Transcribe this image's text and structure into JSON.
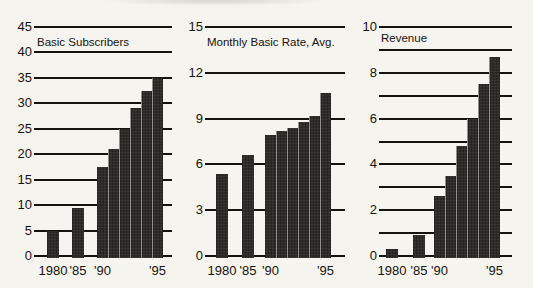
{
  "figure": {
    "background_color": "#f6f4ef",
    "ink_color": "#16120e",
    "bar_color": "#2f2b28"
  },
  "chart_data": [
    {
      "type": "bar",
      "title": "Basic Subscribers",
      "categories": [
        "1980",
        "1985",
        "1990",
        "1991",
        "1992",
        "1993",
        "1994",
        "1995"
      ],
      "values": [
        5,
        9.5,
        17.5,
        21,
        25,
        29,
        32.5,
        35
      ],
      "ylim": [
        0,
        45
      ],
      "grid_step": 5,
      "label_step": 5,
      "ytick_labels": [
        "0",
        "5",
        "10",
        "15",
        "20",
        "25",
        "30",
        "35",
        "40",
        "45"
      ],
      "xtick_labels": [
        {
          "bar_index": 0,
          "label": "1980"
        },
        {
          "bar_index": 1,
          "label": "'85"
        },
        {
          "bar_index": 2,
          "label": "'90"
        },
        {
          "bar_index": 7,
          "label": "'95"
        }
      ],
      "grid": "horizontal",
      "legend": null
    },
    {
      "type": "bar",
      "title": "Monthly Basic Rate, Avg.",
      "categories": [
        "1980",
        "1985",
        "1990",
        "1991",
        "1992",
        "1993",
        "1994",
        "1995"
      ],
      "values": [
        5.4,
        6.6,
        7.9,
        8.2,
        8.4,
        8.8,
        9.2,
        10.7
      ],
      "ylim": [
        0,
        15
      ],
      "grid_step": 3,
      "label_step": 3,
      "ytick_labels": [
        "0",
        "3",
        "6",
        "9",
        "12",
        "15"
      ],
      "xtick_labels": [
        {
          "bar_index": 0,
          "label": "1980"
        },
        {
          "bar_index": 1,
          "label": "'85"
        },
        {
          "bar_index": 2,
          "label": "'90"
        },
        {
          "bar_index": 7,
          "label": "'95"
        }
      ],
      "grid": "horizontal",
      "legend": null
    },
    {
      "type": "bar",
      "title": "Revenue",
      "categories": [
        "1980",
        "1985",
        "1990",
        "1991",
        "1992",
        "1993",
        "1994",
        "1995"
      ],
      "values": [
        0.3,
        0.9,
        2.6,
        3.5,
        4.8,
        6.0,
        7.5,
        8.7
      ],
      "ylim": [
        0,
        10
      ],
      "grid_step": 1,
      "label_step": 2,
      "ytick_labels": [
        "0",
        "2",
        "4",
        "6",
        "8",
        "10"
      ],
      "xtick_labels": [
        {
          "bar_index": 0,
          "label": "1980"
        },
        {
          "bar_index": 1,
          "label": "'85"
        },
        {
          "bar_index": 2,
          "label": "'90"
        },
        {
          "bar_index": 7,
          "label": "'95"
        }
      ],
      "grid": "horizontal",
      "legend": null
    }
  ]
}
